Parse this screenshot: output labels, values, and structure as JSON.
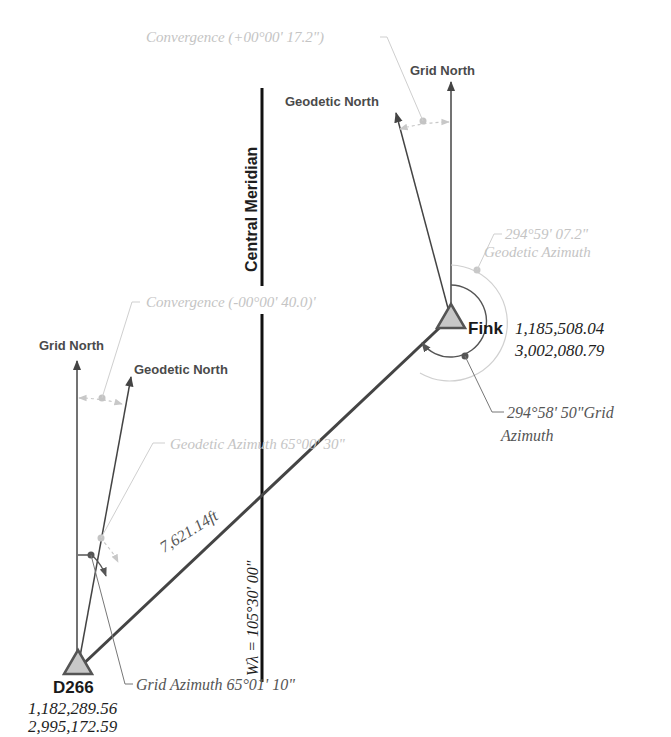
{
  "diagram": {
    "central_meridian": {
      "label": "Central Meridian",
      "longitude_label": "Wλ = 105°30' 00\""
    },
    "stations": {
      "fink": {
        "name": "Fink",
        "northing": "1,185,508.04",
        "easting": "3,002,080.79",
        "grid_north_label": "Grid North",
        "geodetic_north_label": "Geodetic North",
        "convergence_label": "Convergence (+00°00' 17.2\")",
        "geodetic_azimuth_value": "294°59' 07.2\"",
        "geodetic_azimuth_text": "Geodetic Azimuth",
        "grid_azimuth_value": "294°58' 50\"Grid",
        "grid_azimuth_text": "Azimuth"
      },
      "d266": {
        "name": "D266",
        "northing": "1,182,289.56",
        "easting": "2,995,172.59",
        "grid_north_label": "Grid North",
        "geodetic_north_label": "Geodetic North",
        "convergence_label": "Convergence (-00°00' 40.0)'",
        "geodetic_azimuth_label": "Geodetic Azimuth 65°00' 30\"",
        "grid_azimuth_label": "Grid Azimuth 65°01' 10\""
      }
    },
    "line": {
      "distance_label": "7,621.14ft"
    },
    "colors": {
      "primary_line": "#444444",
      "central_meridian": "#111111",
      "faint_annotation": "#c4c4c4",
      "station_fill": "#c8c8c8",
      "station_stroke": "#555555"
    }
  }
}
